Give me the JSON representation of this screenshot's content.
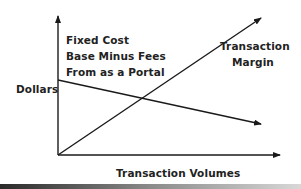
{
  "diagram": {
    "y_axis_label": "Dollars",
    "x_axis_label": "Transaction Volumes",
    "fixed_cost_label": [
      "Fixed Cost",
      "Base Minus Fees",
      "From as a Portal"
    ],
    "margin_label": [
      "Transaction",
      "Margin"
    ],
    "lines": [
      {
        "name": "Fixed Cost Base Minus Fees From as a Portal",
        "trend": "decreasing",
        "start": [
          58,
          80
        ],
        "end": [
          261,
          124
        ]
      },
      {
        "name": "Transaction Margin",
        "trend": "increasing",
        "start": [
          58,
          155
        ],
        "end": [
          261,
          18
        ]
      }
    ],
    "colors": {
      "line": "#1a1a1a",
      "text": "#222222",
      "background": "#ffffff"
    }
  }
}
